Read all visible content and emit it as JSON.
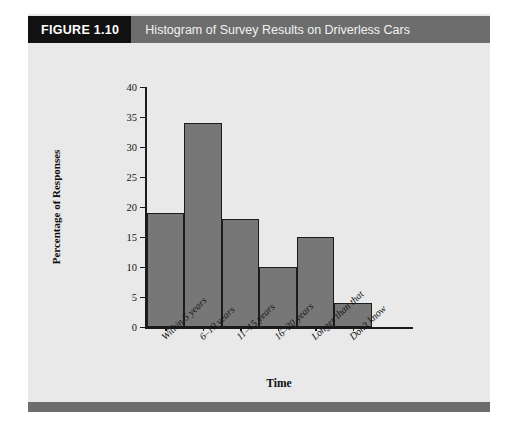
{
  "figure": {
    "number_label": "FIGURE 1.10",
    "title": "Histogram of Survey Results on Driverless Cars"
  },
  "colors": {
    "header_bar": "#6d6d6d",
    "number_box": "#111111",
    "panel_background": "#e9e9e9",
    "bar_fill": "#777777",
    "bar_stroke": "#1c1c1c",
    "footer_bar": "#6d6d6d"
  },
  "chart_data": {
    "type": "bar",
    "title": "Histogram of Survey Results on Driverless Cars",
    "xlabel": "Time",
    "ylabel": "Percentage of Responses",
    "categories": [
      "Within 5 years",
      "6–10 years",
      "11–15 years",
      "16–20 years",
      "Longer than that",
      "Don't know"
    ],
    "values": [
      19,
      34,
      18,
      10,
      15,
      4
    ],
    "ylim": [
      0,
      40
    ],
    "ytick_step": 5,
    "yticks": [
      0,
      5,
      10,
      15,
      20,
      25,
      30,
      35,
      40
    ],
    "ytick_labels": [
      "0",
      "5",
      "10",
      "15",
      "20",
      "25",
      "30",
      "35",
      "40"
    ],
    "grid": false,
    "legend": false
  }
}
